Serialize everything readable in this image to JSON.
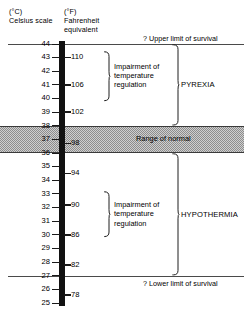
{
  "figure": {
    "headings": {
      "celsius": "(°C)\nCelsius scale",
      "fahrenheit": "(°F)\nFahrenheit\nequivalent"
    },
    "colors": {
      "scale_bar": "#111111",
      "band_fill": "#cfcfcf",
      "band_stipple": "#8d8d8d",
      "rule": "#4a4a4a",
      "text": "#000000"
    }
  },
  "scale": {
    "unit_top_c": 44,
    "unit_bottom_c": 25,
    "celsius_ticks": [
      44,
      43,
      42,
      41,
      40,
      39,
      38,
      37,
      36,
      35,
      34,
      33,
      32,
      31,
      30,
      29,
      28,
      27,
      26,
      25
    ],
    "fahrenheit_ticks": [
      {
        "f": 110,
        "c": 43
      },
      {
        "f": 106,
        "c": 41
      },
      {
        "f": 102,
        "c": 39
      },
      {
        "f": 98,
        "c": 36.7
      },
      {
        "f": 94,
        "c": 34.5
      },
      {
        "f": 90,
        "c": 32.2
      },
      {
        "f": 86,
        "c": 30
      },
      {
        "f": 82,
        "c": 27.8
      },
      {
        "f": 78,
        "c": 25.6
      }
    ]
  },
  "limits": {
    "upper": {
      "label": "? Upper limit of survival",
      "c": 44
    },
    "lower": {
      "label": "? Lower limit of survival",
      "c": 27
    }
  },
  "normal_range": {
    "label": "Range of normal",
    "c_high": 38,
    "c_low": 36
  },
  "zones": [
    {
      "key": "pyrexia",
      "label": "PYREXIA",
      "c_high": 44,
      "c_low": 38
    },
    {
      "key": "hypothermia",
      "label": "HYPOTHERMIA",
      "c_high": 36,
      "c_low": 27
    }
  ],
  "impairment": [
    {
      "key": "impairment-upper",
      "label": "Impairment of\ntemperature\nregulation",
      "c_high": 43.5,
      "c_low": 39.8
    },
    {
      "key": "impairment-lower",
      "label": "Impairment of\ntemperature\nregulation",
      "c_high": 33.2,
      "c_low": 29.8
    }
  ]
}
